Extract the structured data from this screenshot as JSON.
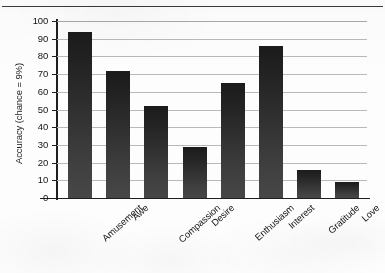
{
  "chart_data": {
    "type": "bar",
    "title": "",
    "subtitle": "",
    "xlabel": "",
    "ylabel": "Accuracy (chance = 9%)",
    "categories": [
      "Amusement",
      "Awe",
      "Compassion",
      "Desire",
      "Enthusiasm",
      "Interest",
      "Gratitude",
      "Love"
    ],
    "values": [
      94,
      72,
      52,
      29,
      65,
      86,
      16,
      9
    ],
    "ylim": [
      0,
      100
    ],
    "yticks": [
      0,
      10,
      20,
      30,
      40,
      50,
      60,
      70,
      80,
      90,
      100
    ],
    "ytick_labels": [
      "0",
      "10",
      "20",
      "30",
      "40",
      "50",
      "60",
      "70",
      "80",
      "90",
      "100"
    ],
    "grid": true,
    "grid_axis": "y",
    "legend": false,
    "legend_position": "none",
    "bar_color": "#2b2b2b",
    "gridline_color": "#b9b9b9",
    "axis_color": "#1e1e1e",
    "background_color": "#fdfdfd",
    "xtick_label_rotation": -42,
    "annotations": []
  },
  "figure": {
    "top_rule": true,
    "top_rule_color": "#3a3a3a"
  }
}
